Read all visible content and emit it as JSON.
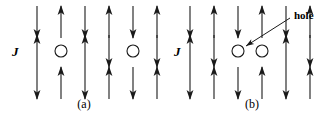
{
  "figure": {
    "stroke_color": "#1a1a1a",
    "background_color": "#ffffff"
  },
  "panels": [
    {
      "id": "a",
      "caption": "(a)",
      "coupling_label": "J",
      "columns_x": [
        37,
        61,
        85,
        109,
        133,
        157
      ],
      "rows_y": [
        22,
        51,
        83
      ],
      "lattice": [
        [
          "down",
          "up",
          "down",
          "up",
          "down",
          "up"
        ],
        [
          "up",
          "circle",
          "up",
          "down",
          "circle",
          "down"
        ],
        [
          "down",
          "up",
          "down",
          "up",
          "down",
          "up"
        ]
      ],
      "annotation": null
    },
    {
      "id": "b",
      "caption": "(b)",
      "coupling_label": "J",
      "columns_x": [
        22,
        46,
        70,
        94,
        118,
        142
      ],
      "rows_y": [
        22,
        51,
        83
      ],
      "lattice": [
        [
          "down",
          "up",
          "down",
          "up",
          "down",
          "up"
        ],
        [
          "up",
          "down",
          "circle",
          "circle",
          "up",
          "down"
        ],
        [
          "down",
          "up",
          "down",
          "up",
          "down",
          "up"
        ]
      ],
      "annotation": {
        "label": "hole",
        "label_x": 126,
        "label_y": 10,
        "leader_from_x": 122,
        "leader_from_y": 18,
        "leader_to_x": 78,
        "leader_to_y": 46
      }
    }
  ],
  "labels": {
    "coupling": "J",
    "hole": "hole",
    "caption_a": "(a)",
    "caption_b": "(b)"
  }
}
